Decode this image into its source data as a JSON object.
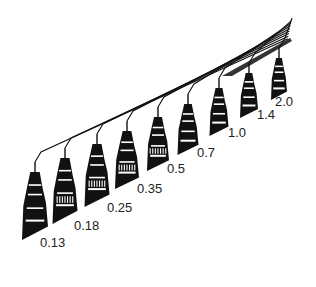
{
  "figure": {
    "colors": {
      "ink": "#111111",
      "background": "#ffffff",
      "label": "#222222"
    },
    "pens": [
      {
        "size": "0.13",
        "x": 35,
        "top": 172,
        "bottom": 240,
        "w": 26,
        "label_x": 40,
        "label_y": 236
      },
      {
        "size": "0.18",
        "x": 65,
        "top": 158,
        "bottom": 224,
        "w": 25,
        "label_x": 74,
        "label_y": 219
      },
      {
        "size": "0.25",
        "x": 97,
        "top": 144,
        "bottom": 207,
        "w": 25,
        "label_x": 107,
        "label_y": 201
      },
      {
        "size": "0.35",
        "x": 127,
        "top": 131,
        "bottom": 189,
        "w": 24,
        "label_x": 137,
        "label_y": 182
      },
      {
        "size": "0.5",
        "x": 158,
        "top": 117,
        "bottom": 171,
        "w": 22,
        "label_x": 167,
        "label_y": 162
      },
      {
        "size": "0.7",
        "x": 188,
        "top": 104,
        "bottom": 155,
        "w": 21,
        "label_x": 197,
        "label_y": 146
      },
      {
        "size": "1.0",
        "x": 219,
        "top": 88,
        "bottom": 136,
        "w": 19,
        "label_x": 228,
        "label_y": 126
      },
      {
        "size": "1.4",
        "x": 249,
        "top": 73,
        "bottom": 118,
        "w": 18,
        "label_x": 257,
        "label_y": 108
      },
      {
        "size": "2.0",
        "x": 279,
        "top": 58,
        "bottom": 100,
        "w": 16,
        "label_x": 275,
        "label_y": 95
      }
    ],
    "line_end": {
      "x": 292,
      "y": 18
    }
  }
}
